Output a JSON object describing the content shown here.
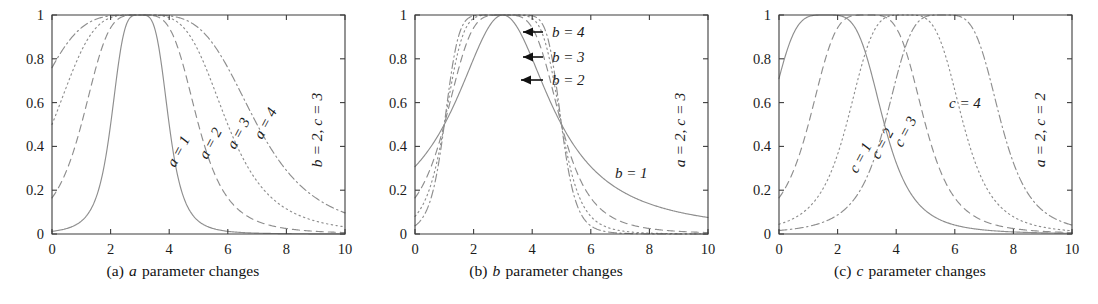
{
  "figure": {
    "type": "multi-panel-line-chart",
    "background": "#ffffff",
    "curve_color": "#8e8e8e",
    "axis_color": "#3d3d3d",
    "text_color": "#1b1b1b"
  },
  "panels": [
    {
      "id": "a",
      "caption_prefix": "(a)",
      "caption_param": "a",
      "caption_suffix": "parameter changes",
      "caption_full": "(a) a parameter changes",
      "fixed_params_note": "b = 2, c = 3",
      "curve_labels": [
        {
          "text": "a = 1",
          "lhs": "a",
          "value": "1"
        },
        {
          "text": "a = 2",
          "lhs": "a",
          "value": "2"
        },
        {
          "text": "a = 3",
          "lhs": "a",
          "value": "3"
        },
        {
          "text": "a = 4",
          "lhs": "a",
          "value": "4"
        }
      ]
    },
    {
      "id": "b",
      "caption_prefix": "(b)",
      "caption_param": "b",
      "caption_suffix": "parameter changes",
      "caption_full": "(b) b parameter changes",
      "fixed_params_note": "a = 2, c = 3",
      "curve_labels": [
        {
          "text": "b = 4",
          "lhs": "b",
          "value": "4"
        },
        {
          "text": "b = 3",
          "lhs": "b",
          "value": "3"
        },
        {
          "text": "b = 2",
          "lhs": "b",
          "value": "2"
        },
        {
          "text": "b = 1",
          "lhs": "b",
          "value": "1"
        }
      ]
    },
    {
      "id": "c",
      "caption_prefix": "(c)",
      "caption_param": "c",
      "caption_suffix": "parameter changes",
      "caption_full": "(c) c parameter changes",
      "fixed_params_note": "a = 2, c = 2",
      "curve_labels": [
        {
          "text": "c = 1",
          "lhs": "c",
          "value": "1"
        },
        {
          "text": "c = 2",
          "lhs": "c",
          "value": "2"
        },
        {
          "text": "c = 3",
          "lhs": "c",
          "value": "3"
        },
        {
          "text": "c = 4",
          "lhs": "c",
          "value": "4"
        }
      ]
    }
  ],
  "chart_data": [
    {
      "type": "line",
      "panel": "a",
      "title": "(a) a parameter changes",
      "xlabel": "",
      "ylabel": "",
      "xlim": [
        0,
        10
      ],
      "ylim": [
        0,
        1
      ],
      "xticks": [
        0,
        2,
        4,
        6,
        8,
        10
      ],
      "yticks": [
        0,
        0.2,
        0.4,
        0.6,
        0.8,
        1
      ],
      "xticklabels": [
        "0",
        "2",
        "4",
        "6",
        "8",
        "10"
      ],
      "yticklabels": [
        "0",
        "0.2",
        "0.4",
        "0.6",
        "0.8",
        "1"
      ],
      "grid": false,
      "legend": "inline-curve-labels",
      "function": "gbell: 1 / (1 + |(x - c)/a|^(2b))",
      "annotation": "b = 2, c = 3",
      "series": [
        {
          "name": "a = 1",
          "a": 1,
          "b": 2,
          "c": 3,
          "style": "solid"
        },
        {
          "name": "a = 2",
          "a": 2,
          "b": 2,
          "c": 3,
          "style": "dashed"
        },
        {
          "name": "a = 3",
          "a": 3,
          "b": 2,
          "c": 3,
          "style": "dotted"
        },
        {
          "name": "a = 4",
          "a": 4,
          "b": 2,
          "c": 3,
          "style": "dashdot"
        }
      ]
    },
    {
      "type": "line",
      "panel": "b",
      "title": "(b) b parameter changes",
      "xlabel": "",
      "ylabel": "",
      "xlim": [
        0,
        10
      ],
      "ylim": [
        0,
        1
      ],
      "xticks": [
        0,
        2,
        4,
        6,
        8,
        10
      ],
      "yticks": [
        0,
        0.2,
        0.4,
        0.6,
        0.8,
        1
      ],
      "xticklabels": [
        "0",
        "2",
        "4",
        "6",
        "8",
        "10"
      ],
      "yticklabels": [
        "0",
        "0.2",
        "0.4",
        "0.6",
        "0.8",
        "1"
      ],
      "grid": false,
      "legend": "inline-curve-labels-with-arrows",
      "function": "gbell: 1 / (1 + |(x - c)/a|^(2b))",
      "annotation": "a = 2, c = 3",
      "series": [
        {
          "name": "b = 1",
          "a": 2,
          "b": 1,
          "c": 3,
          "style": "solid"
        },
        {
          "name": "b = 2",
          "a": 2,
          "b": 2,
          "c": 3,
          "style": "dashed"
        },
        {
          "name": "b = 3",
          "a": 2,
          "b": 3,
          "c": 3,
          "style": "dotted"
        },
        {
          "name": "b = 4",
          "a": 2,
          "b": 4,
          "c": 3,
          "style": "dashdot"
        }
      ]
    },
    {
      "type": "line",
      "panel": "c",
      "title": "(c) c parameter changes",
      "xlabel": "",
      "ylabel": "",
      "xlim": [
        0,
        10
      ],
      "ylim": [
        0,
        1
      ],
      "xticks": [
        0,
        2,
        4,
        6,
        8,
        10
      ],
      "yticks": [
        0,
        0.2,
        0.4,
        0.6,
        0.8,
        1
      ],
      "xticklabels": [
        "0",
        "2",
        "4",
        "6",
        "8",
        "10"
      ],
      "yticklabels": [
        "0",
        "0.2",
        "0.4",
        "0.6",
        "0.8",
        "1"
      ],
      "grid": false,
      "legend": "inline-curve-labels",
      "function": "gbell: 1 / (1 + |(x - c)/a|^(2b))",
      "annotation": "a = 2, c = 2",
      "series": [
        {
          "name": "c = 1",
          "a": 2,
          "b": 2,
          "c": 1.6,
          "style": "solid"
        },
        {
          "name": "c = 2",
          "a": 2,
          "b": 2,
          "c": 3.0,
          "style": "dashed"
        },
        {
          "name": "c = 3",
          "a": 2,
          "b": 2,
          "c": 4.3,
          "style": "dotted"
        },
        {
          "name": "c = 4",
          "a": 2,
          "b": 2,
          "c": 5.6,
          "style": "dashdot"
        }
      ]
    }
  ],
  "labels": {
    "panel_a": {
      "a1": "a = 1",
      "a2": "a = 2",
      "a3": "a = 3",
      "a4": "a = 4",
      "note": "b = 2, c = 3"
    },
    "panel_b": {
      "b4": "b = 4",
      "b3": "b = 3",
      "b2": "b = 2",
      "b1": "b = 1",
      "note": "a = 2, c = 3"
    },
    "panel_c": {
      "c1": "c = 1",
      "c2": "c = 2",
      "c3": "c = 3",
      "c4": "c = 4",
      "note": "a = 2, c = 2"
    }
  }
}
